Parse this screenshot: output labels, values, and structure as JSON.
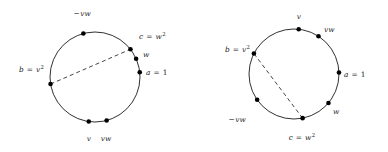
{
  "figure": {
    "background_color": "#ffffff",
    "stroke_color": "#1a1a1a",
    "dot_color": "#000000",
    "dash_color": "#303030"
  },
  "diagrams": [
    {
      "id": "left-circle",
      "name": "left-circle-diagram",
      "center": [
        95,
        77
      ],
      "radius": 45,
      "chord": {
        "name": "dashed-chord-left",
        "from_point": "b",
        "to_point": "c",
        "style": "dashed"
      },
      "points": [
        {
          "key": "minus-vw",
          "name": "point-minus-vw",
          "angle_deg": 105,
          "label_text": "−vw",
          "label_parts": {
            "prefix": "−",
            "body": "vw",
            "exp": ""
          },
          "label_pos": [
            73,
            10
          ],
          "label_align": "start"
        },
        {
          "key": "c",
          "name": "point-c",
          "angle_deg": 38,
          "label_text": "c = w²",
          "label_parts": {
            "lhs": "c",
            "op": "=",
            "rhs": "w",
            "exp": "2"
          },
          "label_pos": [
            139,
            33
          ],
          "label_align": "start"
        },
        {
          "key": "w",
          "name": "point-w",
          "angle_deg": 24,
          "label_text": "w",
          "label_parts": {
            "lhs": "w",
            "op": "",
            "rhs": "",
            "exp": ""
          },
          "label_pos": [
            143,
            51
          ],
          "label_align": "start"
        },
        {
          "key": "a",
          "name": "point-a",
          "angle_deg": 6,
          "label_text": "a = 1",
          "label_parts": {
            "lhs": "a",
            "op": "=",
            "rhs": "1",
            "exp": ""
          },
          "label_pos": [
            146,
            69
          ],
          "label_align": "start"
        },
        {
          "key": "vw",
          "name": "point-vw",
          "angle_deg": 285,
          "label_text": "vw",
          "label_parts": {
            "lhs": "vw",
            "op": "",
            "rhs": "",
            "exp": ""
          },
          "label_pos": [
            106,
            135
          ],
          "label_align": "middle"
        },
        {
          "key": "v",
          "name": "point-v",
          "angle_deg": 262,
          "label_text": "v",
          "label_parts": {
            "lhs": "v",
            "op": "",
            "rhs": "",
            "exp": ""
          },
          "label_pos": [
            89,
            135
          ],
          "label_align": "middle"
        },
        {
          "key": "b",
          "name": "point-b",
          "angle_deg": 189,
          "label_text": "b = v²",
          "label_parts": {
            "lhs": "b",
            "op": "=",
            "rhs": "v",
            "exp": "2"
          },
          "label_pos": [
            44,
            66
          ],
          "label_align": "end"
        }
      ]
    },
    {
      "id": "right-circle",
      "name": "right-circle-diagram",
      "center": [
        294,
        74
      ],
      "radius": 45,
      "chord": {
        "name": "dashed-chord-right",
        "from_point": "b",
        "to_point": "c",
        "style": "dashed"
      },
      "points": [
        {
          "key": "v",
          "name": "point-v",
          "angle_deg": 84,
          "label_text": "v",
          "label_parts": {
            "lhs": "v",
            "op": "",
            "rhs": "",
            "exp": ""
          },
          "label_pos": [
            299,
            13
          ],
          "label_align": "middle"
        },
        {
          "key": "vw",
          "name": "point-vw",
          "angle_deg": 57,
          "label_text": "vw",
          "label_parts": {
            "lhs": "vw",
            "op": "",
            "rhs": "",
            "exp": ""
          },
          "label_pos": [
            324,
            26
          ],
          "label_align": "start"
        },
        {
          "key": "a",
          "name": "point-a",
          "angle_deg": 2,
          "label_text": "a = 1",
          "label_parts": {
            "lhs": "a",
            "op": "=",
            "rhs": "1",
            "exp": ""
          },
          "label_pos": [
            344,
            71
          ],
          "label_align": "start"
        },
        {
          "key": "w",
          "name": "point-w",
          "angle_deg": -40,
          "label_text": "w",
          "label_parts": {
            "lhs": "w",
            "op": "",
            "rhs": "",
            "exp": ""
          },
          "label_pos": [
            333,
            108
          ],
          "label_align": "start"
        },
        {
          "key": "c",
          "name": "point-c",
          "angle_deg": -79,
          "label_text": "c = w²",
          "label_parts": {
            "lhs": "c",
            "op": "=",
            "rhs": "w",
            "exp": "2"
          },
          "label_pos": [
            302,
            134
          ],
          "label_align": "middle"
        },
        {
          "key": "minus-vw",
          "name": "point-minus-vw",
          "angle_deg": 215,
          "label_text": "−vw",
          "label_parts": {
            "prefix": "−",
            "body": "vw",
            "exp": ""
          },
          "label_pos": [
            246,
            116
          ],
          "label_align": "end"
        },
        {
          "key": "b",
          "name": "point-b",
          "angle_deg": 153,
          "label_text": "b = v²",
          "label_parts": {
            "lhs": "b",
            "op": "=",
            "rhs": "v",
            "exp": "2"
          },
          "label_pos": [
            250,
            46
          ],
          "label_align": "end"
        }
      ]
    }
  ]
}
